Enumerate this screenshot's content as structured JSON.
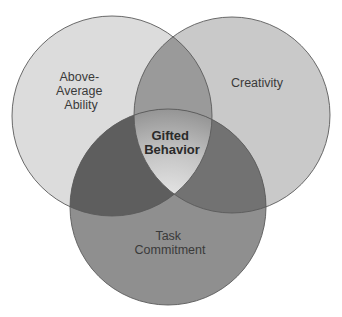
{
  "diagram": {
    "type": "venn-3",
    "sets": [
      {
        "id": "ability",
        "label_lines": [
          "Above-",
          "Average",
          "Ability"
        ],
        "fill": "#dcdcdc"
      },
      {
        "id": "creativity",
        "label_lines": [
          "Creativity"
        ],
        "fill": "#c8c8c8"
      },
      {
        "id": "task",
        "label_lines": [
          "Task",
          "Commitment"
        ],
        "fill": "#8e8e8e"
      }
    ],
    "intersection_all": {
      "label_lines": [
        "Gifted",
        "Behavior"
      ]
    },
    "colors": {
      "ability_only": "#dcdcdc",
      "creativity_only": "#c9c9c9",
      "task_only": "#8f8f8f",
      "ability_creativity": "#9a9a9a",
      "ability_task": "#5e5e5e",
      "creativity_task": "#727272",
      "center_highlight": "#f2f2f2",
      "center_edge": "#8a8a8a",
      "stroke": "#5a5a5a"
    }
  }
}
